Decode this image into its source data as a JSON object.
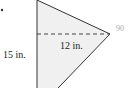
{
  "diagram": {
    "shape": "triangle",
    "height_label": "15 in.",
    "base_label": "12 in.",
    "angle_label": "90",
    "colors": {
      "fill": "#f0f0f0",
      "stroke": "#333333",
      "dashed": "#444444",
      "angle_label": "#aaaaaa"
    }
  }
}
